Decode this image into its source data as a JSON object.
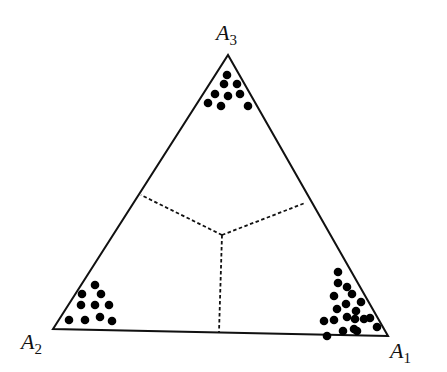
{
  "diagram": {
    "type": "ternary simplex with Voronoi-like decision regions",
    "stroke_color": "#111111",
    "dot_color": "#000000",
    "vertices": [
      {
        "id": "A1",
        "base": "A",
        "sub": "1",
        "x": 388,
        "y": 336,
        "label_x": 390,
        "label_y": 340
      },
      {
        "id": "A2",
        "base": "A",
        "sub": "2",
        "x": 53,
        "y": 329,
        "label_x": 21,
        "label_y": 331
      },
      {
        "id": "A3",
        "base": "A",
        "sub": "3",
        "x": 228,
        "y": 55,
        "label_x": 216,
        "label_y": 22
      }
    ],
    "dashed_boundaries": [
      {
        "from": [
          222,
          235
        ],
        "to": [
          141,
          195
        ]
      },
      {
        "from": [
          222,
          235
        ],
        "to": [
          305,
          203
        ]
      },
      {
        "from": [
          222,
          235
        ],
        "to": [
          219,
          332
        ]
      }
    ],
    "clusters": [
      {
        "vertex": "A3",
        "points": [
          [
            227,
            75
          ],
          [
            224,
            84
          ],
          [
            237,
            84
          ],
          [
            215,
            94
          ],
          [
            228,
            96
          ],
          [
            240,
            94
          ],
          [
            208,
            103
          ],
          [
            221,
            106
          ],
          [
            248,
            106
          ]
        ]
      },
      {
        "vertex": "A2",
        "points": [
          [
            95,
            285
          ],
          [
            82,
            294
          ],
          [
            101,
            294
          ],
          [
            81,
            305
          ],
          [
            95,
            305
          ],
          [
            109,
            305
          ],
          [
            69,
            320
          ],
          [
            85,
            320
          ],
          [
            100,
            317
          ],
          [
            112,
            321
          ]
        ]
      },
      {
        "vertex": "A1",
        "points": [
          [
            338,
            272
          ],
          [
            338,
            283
          ],
          [
            347,
            287
          ],
          [
            334,
            296
          ],
          [
            352,
            294
          ],
          [
            346,
            304
          ],
          [
            361,
            302
          ],
          [
            337,
            309
          ],
          [
            356,
            311
          ],
          [
            334,
            320
          ],
          [
            347,
            317
          ],
          [
            364,
            319
          ],
          [
            355,
            319
          ],
          [
            324,
            321
          ],
          [
            354,
            329
          ],
          [
            370,
            318
          ],
          [
            343,
            331
          ],
          [
            357,
            331
          ],
          [
            377,
            327
          ],
          [
            327,
            336
          ]
        ]
      }
    ]
  }
}
